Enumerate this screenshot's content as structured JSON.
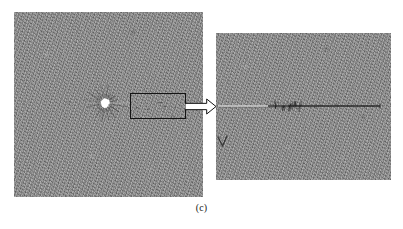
{
  "figure": {
    "caption": "(c)",
    "background_color": "#ffffff",
    "panel_fill_color": "#8c8c8c",
    "annotation_color": "#1b1b1b",
    "highlight_color": "#ffffff"
  },
  "left_panel": {
    "name": "wide-field-radiograph",
    "x": 14,
    "y": 12,
    "width": 189,
    "height": 185,
    "bright_blob": {
      "label": "bright-impact-core",
      "center_x": 105,
      "center_y": 103,
      "radius": 4.5,
      "color": "#ffffff"
    },
    "radial_streaks": {
      "label": "radial-streaks",
      "count": 16,
      "color": "#3b3b3b"
    },
    "roi_box": {
      "label": "region-of-interest",
      "x": 130,
      "y": 93,
      "width": 55,
      "height": 25,
      "stroke_color": "#141414",
      "stroke_width": 1
    }
  },
  "arrow": {
    "label": "magnify-arrow",
    "x": 185,
    "y": 99,
    "width": 31,
    "height": 15,
    "fill_color": "#ffffff",
    "stroke_color": "#141414",
    "direction": "right"
  },
  "right_panel": {
    "name": "magnified-detail-view",
    "x": 216,
    "y": 33,
    "width": 175,
    "height": 147,
    "horizontal_trace": {
      "label": "crack-trace",
      "y": 106,
      "x_start": 218,
      "x_end": 380,
      "light_segment_end": 288,
      "light_color": "#d8d8d8",
      "dark_color": "#242424"
    },
    "tick_cluster": {
      "label": "tick-cluster",
      "x_start": 273,
      "x_end": 302,
      "color": "#1f1f1f"
    },
    "v_marker": {
      "label": "v-marker",
      "x": 218,
      "y": 137,
      "width": 9,
      "height": 9,
      "color": "#262626"
    }
  }
}
